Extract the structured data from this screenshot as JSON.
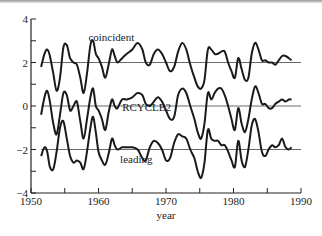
{
  "chart_data": {
    "type": "line",
    "title": "",
    "xlabel": "year",
    "ylabel": "",
    "xlim": [
      1950,
      1990
    ],
    "ylim": [
      -4,
      4
    ],
    "grid": false,
    "x_ticks": [
      1950,
      1960,
      1970,
      1980,
      1990
    ],
    "x_minor_ticks": [
      1955,
      1965,
      1975,
      1985
    ],
    "y_ticks": [
      4,
      2,
      0,
      -2,
      -4
    ],
    "y_minor_ticks": [
      3,
      1,
      -1,
      -3
    ],
    "reference_lines": [
      2,
      0,
      -2
    ],
    "legend": "none (inline labels)",
    "series": [
      {
        "name": "coincident",
        "label_position": {
          "x": 1958.5,
          "y": 3.0
        },
        "baseline": 2,
        "x": [
          1951.5,
          1952,
          1952.4,
          1952.8,
          1953.3,
          1953.8,
          1954.3,
          1954.8,
          1955.3,
          1955.8,
          1956.3,
          1956.8,
          1957.3,
          1957.8,
          1958.3,
          1958.8,
          1959.2,
          1959.6,
          1960,
          1960.5,
          1961,
          1961.5,
          1962,
          1962.4,
          1962.8,
          1963.5,
          1964.2,
          1965,
          1965.8,
          1966.5,
          1967,
          1967.6,
          1968.2,
          1968.8,
          1969.4,
          1970,
          1970.6,
          1971.2,
          1971.8,
          1972.4,
          1973,
          1973.6,
          1974.2,
          1974.7,
          1975.2,
          1975.7,
          1976.2,
          1976.7,
          1977.2,
          1977.7,
          1978.2,
          1978.7,
          1979.2,
          1979.7,
          1980.2,
          1980.7,
          1981.2,
          1981.7,
          1982.2,
          1982.7,
          1983.2,
          1983.7,
          1984.2,
          1984.7,
          1985.2,
          1985.7,
          1986.2,
          1986.7,
          1987.2,
          1987.7,
          1988.2,
          1988.6
        ],
        "values": [
          1.8,
          2.4,
          2.6,
          2.3,
          1.5,
          0.7,
          1.3,
          2.7,
          2.8,
          2.2,
          2.0,
          1.9,
          1.3,
          0.6,
          1.5,
          2.8,
          3.0,
          2.4,
          2.2,
          1.8,
          1.3,
          1.9,
          2.6,
          2.3,
          2.0,
          2.2,
          2.4,
          2.6,
          2.9,
          2.6,
          2.0,
          1.9,
          2.4,
          2.6,
          2.4,
          2.0,
          1.6,
          1.8,
          2.5,
          2.9,
          2.6,
          1.9,
          1.3,
          0.9,
          0.8,
          1.2,
          2.6,
          2.6,
          2.4,
          2.4,
          2.5,
          2.5,
          2.0,
          1.6,
          1.3,
          2.2,
          1.7,
          1.2,
          1.3,
          2.4,
          2.9,
          2.6,
          2.1,
          2.1,
          2.0,
          2.0,
          1.9,
          2.1,
          2.3,
          2.3,
          2.2,
          2.1
        ]
      },
      {
        "name": "RCYCLE2",
        "label_position": {
          "x": 1963.5,
          "y": -0.25
        },
        "baseline": 0,
        "x": [
          1951.5,
          1952,
          1952.4,
          1952.8,
          1953.3,
          1953.8,
          1954.3,
          1954.8,
          1955.3,
          1955.8,
          1956.3,
          1956.8,
          1957.3,
          1957.8,
          1958.3,
          1958.8,
          1959.2,
          1959.6,
          1960,
          1960.5,
          1961,
          1961.5,
          1962,
          1962.4,
          1962.8,
          1963.5,
          1964.2,
          1965,
          1965.8,
          1966.5,
          1967,
          1967.6,
          1968.2,
          1968.8,
          1969.4,
          1970,
          1970.6,
          1971.2,
          1971.8,
          1972.4,
          1973,
          1973.6,
          1974.2,
          1974.7,
          1975.2,
          1975.7,
          1976.2,
          1976.7,
          1977.2,
          1977.7,
          1978.2,
          1978.7,
          1979.2,
          1979.7,
          1980.2,
          1980.7,
          1981.2,
          1981.7,
          1982.2,
          1982.7,
          1983.2,
          1983.7,
          1984.2,
          1984.7,
          1985.2,
          1985.7,
          1986.2,
          1986.7,
          1987.2,
          1987.7,
          1988.2,
          1988.6
        ],
        "values": [
          -0.4,
          0.4,
          0.7,
          0.2,
          -0.8,
          -1.3,
          -0.4,
          0.6,
          0.5,
          -0.2,
          0.0,
          0.2,
          -0.7,
          -1.5,
          -0.6,
          0.4,
          0.8,
          0.0,
          -0.2,
          -0.6,
          -1.1,
          -0.3,
          0.3,
          0.0,
          -0.1,
          0.3,
          0.3,
          0.4,
          0.6,
          0.5,
          0.1,
          0.0,
          0.2,
          0.4,
          0.2,
          -0.2,
          -0.6,
          -0.5,
          0.5,
          0.8,
          0.6,
          0.0,
          -0.6,
          -1.2,
          -1.5,
          -0.8,
          0.6,
          0.3,
          0.6,
          0.8,
          0.8,
          0.5,
          0.0,
          -0.6,
          -1.1,
          -0.1,
          -0.8,
          -1.2,
          -0.6,
          0.3,
          0.9,
          0.6,
          0.1,
          0.1,
          -0.1,
          -0.1,
          0.1,
          0.2,
          0.3,
          0.2,
          0.3,
          0.3
        ]
      },
      {
        "name": "leading",
        "label_position": {
          "x": 1963.2,
          "y": -2.6
        },
        "baseline": -2,
        "x": [
          1951.5,
          1952,
          1952.4,
          1952.8,
          1953.3,
          1953.8,
          1954.3,
          1954.8,
          1955.3,
          1955.8,
          1956.3,
          1956.8,
          1957.3,
          1957.8,
          1958.3,
          1958.8,
          1959.2,
          1959.6,
          1960,
          1960.5,
          1961,
          1961.5,
          1962,
          1962.4,
          1962.8,
          1963.5,
          1964.2,
          1965,
          1965.8,
          1966.5,
          1967,
          1967.6,
          1968.2,
          1968.8,
          1969.4,
          1970,
          1970.6,
          1971.2,
          1971.8,
          1972.4,
          1973,
          1973.6,
          1974.2,
          1974.7,
          1975.2,
          1975.7,
          1976.2,
          1976.7,
          1977.2,
          1977.7,
          1978.2,
          1978.7,
          1979.2,
          1979.7,
          1980.2,
          1980.7,
          1981.2,
          1981.7,
          1982.2,
          1982.7,
          1983.2,
          1983.7,
          1984.2,
          1984.7,
          1985.2,
          1985.7,
          1986.2,
          1986.7,
          1987.2,
          1987.7,
          1988.2,
          1988.6
        ],
        "values": [
          -2.3,
          -1.9,
          -2.1,
          -2.8,
          -2.9,
          -2.1,
          -1.0,
          -0.7,
          -1.5,
          -2.3,
          -2.6,
          -2.5,
          -2.6,
          -2.9,
          -2.1,
          -1.0,
          -0.5,
          -1.2,
          -2.1,
          -2.5,
          -2.7,
          -2.2,
          -1.5,
          -1.8,
          -2.0,
          -1.9,
          -1.9,
          -1.9,
          -2.0,
          -2.4,
          -2.5,
          -1.9,
          -1.6,
          -1.7,
          -2.0,
          -2.5,
          -2.4,
          -1.7,
          -1.3,
          -1.4,
          -1.5,
          -2.0,
          -2.4,
          -3.0,
          -3.3,
          -2.6,
          -1.1,
          -1.5,
          -1.6,
          -1.6,
          -1.8,
          -1.8,
          -2.1,
          -2.5,
          -2.8,
          -1.6,
          -2.5,
          -2.8,
          -2.0,
          -0.9,
          -0.6,
          -1.2,
          -2.1,
          -2.3,
          -2.0,
          -1.8,
          -1.9,
          -1.8,
          -1.5,
          -1.9,
          -2.0,
          -1.9
        ]
      }
    ]
  },
  "labels": {
    "xlabel": "year",
    "x_ticks": [
      "1950",
      "1960",
      "1970",
      "1980",
      "1990"
    ],
    "y_ticks": [
      "4",
      "2",
      "0",
      "−2",
      "−4"
    ],
    "series": [
      "coincident",
      "RCYCLE2",
      "leading"
    ]
  }
}
